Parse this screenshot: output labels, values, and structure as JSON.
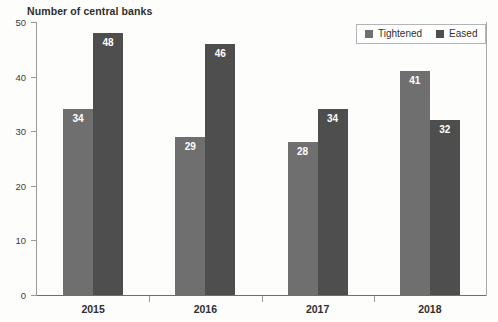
{
  "chart_data": {
    "type": "bar",
    "title": "Number of central banks",
    "xlabel": "",
    "ylabel": "",
    "categories": [
      "2015",
      "2016",
      "2017",
      "2018"
    ],
    "series": [
      {
        "name": "Tightened",
        "values": [
          34,
          29,
          28,
          41
        ],
        "color": "#6f6f6f"
      },
      {
        "name": "Eased",
        "values": [
          48,
          46,
          34,
          32
        ],
        "color": "#4e4e4e"
      }
    ],
    "ylim": [
      0,
      50
    ],
    "yticks": [
      0,
      10,
      20,
      30,
      40,
      50
    ],
    "ytick_labels": [
      "0",
      "10",
      "20",
      "30",
      "40",
      "50"
    ],
    "grid": false,
    "legend_position": "top-right",
    "data_labels": true,
    "data_label_color": "#ffffff"
  },
  "legend": {
    "entries": [
      {
        "label": "Tightened",
        "color": "#6f6f6f"
      },
      {
        "label": "Eased",
        "color": "#4e4e4e"
      }
    ]
  },
  "axis": {
    "y_labels": [
      "50",
      "40",
      "30",
      "20",
      "10",
      "0"
    ],
    "x_labels": [
      "2015",
      "2016",
      "2017",
      "2018"
    ]
  },
  "bars": [
    {
      "label": "34",
      "value": 34,
      "series": "Tightened",
      "category": "2015"
    },
    {
      "label": "48",
      "value": 48,
      "series": "Eased",
      "category": "2015"
    },
    {
      "label": "29",
      "value": 29,
      "series": "Tightened",
      "category": "2016"
    },
    {
      "label": "46",
      "value": 46,
      "series": "Eased",
      "category": "2016"
    },
    {
      "label": "28",
      "value": 28,
      "series": "Tightened",
      "category": "2017"
    },
    {
      "label": "34",
      "value": 34,
      "series": "Eased",
      "category": "2017"
    },
    {
      "label": "41",
      "value": 41,
      "series": "Tightened",
      "category": "2018"
    },
    {
      "label": "32",
      "value": 32,
      "series": "Eased",
      "category": "2018"
    }
  ]
}
